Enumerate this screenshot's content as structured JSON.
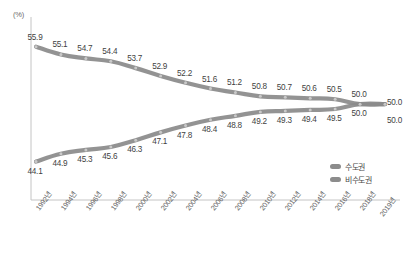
{
  "chart_data": {
    "type": "line",
    "title": "",
    "subtitle": "",
    "unit_label": "(%)",
    "xlabel": "",
    "ylabel": "",
    "ylim": [
      42,
      57
    ],
    "grid": false,
    "legend_position": "bottom-right",
    "categories": [
      "1992년",
      "1994년",
      "1996년",
      "1998년",
      "2000년",
      "2002년",
      "2004년",
      "2006년",
      "2008년",
      "2010년",
      "2012년",
      "2014년",
      "2016년",
      "2018년",
      "2019년"
    ],
    "tick_labels": [
      "1992년",
      "1994년",
      "1996년",
      "1998년",
      "2000년",
      "2002년",
      "2004년",
      "2006년",
      "2008년",
      "2010년",
      "2012년",
      "2014년",
      "2016년",
      "2018년",
      "2019년"
    ],
    "series": [
      {
        "name": "수도권",
        "color": "#8a8a8a",
        "values": [
          55.9,
          55.1,
          54.7,
          54.4,
          53.7,
          52.9,
          52.2,
          51.6,
          51.2,
          50.8,
          50.7,
          50.6,
          50.5,
          50.0,
          50.0
        ],
        "labels": [
          "55.9",
          "55.1",
          "54.7",
          "54.4",
          "53.7",
          "52.9",
          "52.2",
          "51.6",
          "51.2",
          "50.8",
          "50.7",
          "50.6",
          "50.5",
          "50.0",
          ""
        ]
      },
      {
        "name": "비수도권",
        "color": "#8a8a8a",
        "values": [
          44.1,
          44.9,
          45.3,
          45.6,
          46.3,
          47.1,
          47.8,
          48.4,
          48.8,
          49.2,
          49.3,
          49.4,
          49.5,
          50.0,
          50.0
        ],
        "labels": [
          "44.1",
          "44.9",
          "45.3",
          "45.6",
          "46.3",
          "47.1",
          "47.8",
          "48.4",
          "48.8",
          "49.2",
          "49.3",
          "49.4",
          "49.5",
          "50.0",
          ""
        ]
      }
    ]
  },
  "legend": {
    "items": [
      {
        "label": "수도권",
        "color": "#8c8c8c"
      },
      {
        "label": "비수도권",
        "color": "#8c8c8c"
      }
    ]
  },
  "axis": {
    "unit": "(%)",
    "axis_color": "#bdbdbd"
  }
}
